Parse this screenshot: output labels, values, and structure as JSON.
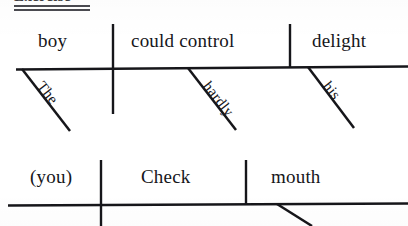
{
  "page": {
    "background_color": "#ffffff",
    "ink_color": "#16161a",
    "width": 408,
    "height": 226
  },
  "heading": {
    "text": "Exercise",
    "underline_style": "double",
    "cropped": true
  },
  "diagrams": [
    {
      "id": "diagram-1",
      "sentence": "The boy could hardly control his delight.",
      "baseline_y": 69,
      "slots": [
        {
          "role": "subject",
          "text": "boy"
        },
        {
          "role": "verb",
          "text": "could control"
        },
        {
          "role": "direct-object",
          "text": "delight"
        }
      ],
      "modifiers": [
        {
          "attaches_to": "boy",
          "text": "The",
          "type": "article"
        },
        {
          "attaches_to": "could control",
          "text": "hardly",
          "type": "adverb"
        },
        {
          "attaches_to": "delight",
          "text": "his",
          "type": "possessive-adjective"
        }
      ],
      "dividers": [
        {
          "after": "boy",
          "crosses_baseline": true
        },
        {
          "after": "could control",
          "crosses_baseline": false
        }
      ]
    },
    {
      "id": "diagram-2",
      "sentence": "Check your mouth.",
      "baseline_y": 205,
      "slots": [
        {
          "role": "subject",
          "text": "(you)"
        },
        {
          "role": "verb",
          "text": "Check"
        },
        {
          "role": "direct-object",
          "text": "mouth"
        }
      ],
      "modifiers": [
        {
          "attaches_to": "mouth",
          "text": "",
          "type": "possessive-adjective",
          "cropped": true
        }
      ],
      "dividers": [
        {
          "after": "(you)",
          "crosses_baseline": true
        },
        {
          "after": "Check",
          "crosses_baseline": false
        }
      ]
    }
  ]
}
